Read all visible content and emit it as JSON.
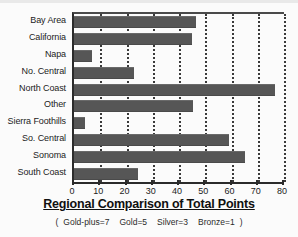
{
  "chart_data": {
    "type": "bar",
    "orientation": "horizontal",
    "title": "Regional Comparison of Total Points",
    "xlabel": "",
    "ylabel": "",
    "xlim": [
      0,
      80
    ],
    "xticks": [
      0,
      10,
      20,
      30,
      40,
      50,
      60,
      70,
      80
    ],
    "grid": "vertical-dotted",
    "legend": "none",
    "bar_color": "#565656",
    "categories": [
      "Bay Area",
      "California",
      "Napa",
      "No. Central",
      "North Coast",
      "Other",
      "Sierra Foothills",
      "So. Central",
      "Sonoma",
      "South Coast"
    ],
    "values": [
      46.5,
      45,
      7,
      23,
      76.5,
      45.5,
      4,
      59,
      65,
      24.5
    ],
    "annotations": [
      "Gold-plus=7",
      "Gold=5",
      "Silver=3",
      "Bronze=1"
    ],
    "footnote_open": "(",
    "footnote_close": ")"
  }
}
